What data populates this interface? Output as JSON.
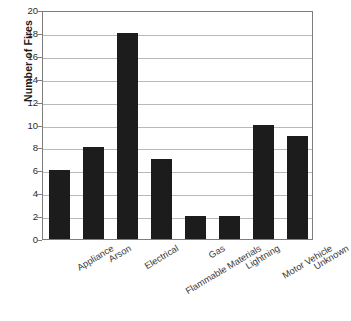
{
  "chart_data": {
    "type": "bar",
    "title": "",
    "xlabel": "",
    "ylabel": "Number of Fires",
    "categories": [
      "Appliance",
      "Arson",
      "Electrical",
      "Flammable Materials",
      "Gas",
      "Lightning",
      "Motor Vehicle",
      "Unknown"
    ],
    "values": [
      6,
      8,
      18,
      7,
      2,
      2,
      10,
      9
    ],
    "ylim": [
      0,
      20
    ],
    "ytick_values": [
      0,
      2,
      4,
      6,
      8,
      10,
      12,
      14,
      16,
      18,
      20
    ],
    "ytick_labels": [
      "0",
      "2",
      "4",
      "6",
      "8",
      "10",
      "12",
      "14",
      "16",
      "18",
      "20"
    ],
    "grid": "horizontal",
    "legend": "none",
    "bar_color": "#1c1c1c",
    "grid_color": "#b9b9b9",
    "frame_color": "#7d7d7d",
    "background_color": "#ffffff",
    "xtick_label_rotation": -31
  }
}
